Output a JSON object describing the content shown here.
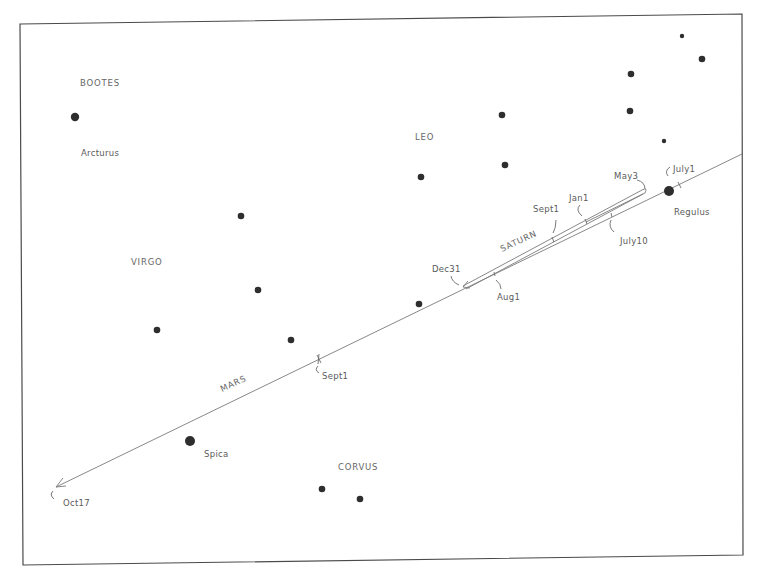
{
  "constellations": [
    {
      "name": "BOOTES",
      "x": 80,
      "y": 86
    },
    {
      "name": "VIRGO",
      "x": 131,
      "y": 265
    },
    {
      "name": "LEO",
      "x": 415,
      "y": 140
    },
    {
      "name": "CORVUS",
      "x": 338,
      "y": 470
    }
  ],
  "named_stars": [
    {
      "name": "Arcturus",
      "x": 81,
      "y": 156,
      "star_x": 75,
      "star_y": 117,
      "r": 4.2
    },
    {
      "name": "Regulus",
      "x": 674,
      "y": 215,
      "star_x": 669,
      "star_y": 191,
      "r": 5
    },
    {
      "name": "Spica",
      "x": 204,
      "y": 457,
      "star_x": 190,
      "star_y": 441,
      "r": 5
    }
  ],
  "stars": [
    {
      "x": 241,
      "y": 216,
      "r": 3.3
    },
    {
      "x": 258,
      "y": 290,
      "r": 3.3
    },
    {
      "x": 157,
      "y": 330,
      "r": 3.3
    },
    {
      "x": 291,
      "y": 340,
      "r": 3.3
    },
    {
      "x": 421,
      "y": 177,
      "r": 3.3
    },
    {
      "x": 419,
      "y": 304,
      "r": 3.3
    },
    {
      "x": 502,
      "y": 115,
      "r": 3.3
    },
    {
      "x": 505,
      "y": 165,
      "r": 3.3
    },
    {
      "x": 631,
      "y": 74,
      "r": 3.3
    },
    {
      "x": 630,
      "y": 111,
      "r": 3.3
    },
    {
      "x": 702,
      "y": 59,
      "r": 3.3
    },
    {
      "x": 682,
      "y": 36,
      "r": 2.2
    },
    {
      "x": 664,
      "y": 141,
      "r": 2.2
    },
    {
      "x": 322,
      "y": 489,
      "r": 3.3
    },
    {
      "x": 360,
      "y": 499,
      "r": 3.3
    }
  ],
  "planets": [
    {
      "name": "MARS",
      "label_x": 222,
      "label_y": 392,
      "rotate": -25
    },
    {
      "name": "SATURN",
      "label_x": 502,
      "label_y": 252,
      "rotate": -25
    }
  ],
  "date_labels": [
    {
      "text": "Oct17",
      "x": 63,
      "y": 506
    },
    {
      "text": "Sept1",
      "x": 322,
      "y": 379
    },
    {
      "text": "Dec31",
      "x": 432,
      "y": 272
    },
    {
      "text": "Aug1",
      "x": 497,
      "y": 300
    },
    {
      "text": "Sept1",
      "x": 533,
      "y": 212
    },
    {
      "text": "Jan1",
      "x": 569,
      "y": 201
    },
    {
      "text": "July10",
      "x": 620,
      "y": 244
    },
    {
      "text": "May3",
      "x": 614,
      "y": 179
    },
    {
      "text": "July1",
      "x": 673,
      "y": 172
    }
  ],
  "colors": {
    "background": "#ffffff",
    "ink": "#2e2e2e",
    "line": "#7a7a7a",
    "label": "#5a5a5a"
  }
}
